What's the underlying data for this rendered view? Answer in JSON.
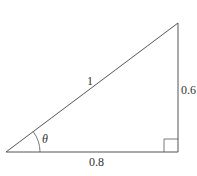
{
  "diagram": {
    "type": "right-triangle",
    "labels": {
      "hypotenuse": "1",
      "opposite": "0.6",
      "adjacent": "0.8",
      "angle": "θ"
    },
    "colors": {
      "stroke": "#555555",
      "text": "#333333",
      "background": "#ffffff"
    }
  }
}
